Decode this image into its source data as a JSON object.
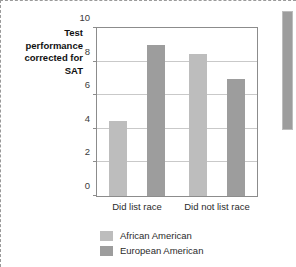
{
  "figure": {
    "axis_title": "Test\nperformance\ncorrected for\nSAT"
  },
  "chart_data": {
    "type": "bar",
    "title": "",
    "xlabel": "",
    "ylabel": "Test performance corrected for SAT",
    "categories": [
      "Did list race",
      "Did not list race"
    ],
    "series": [
      {
        "name": "African American",
        "color": "#bdbdbd",
        "values": [
          4.45,
          8.45
        ]
      },
      {
        "name": "European American",
        "color": "#9d9d9d",
        "values": [
          9.0,
          6.95
        ]
      }
    ],
    "ylim": [
      0,
      10
    ],
    "yticks": [
      0,
      2,
      4,
      6,
      8,
      10
    ],
    "ytick_labels": [
      "0",
      "2",
      "4",
      "6",
      "8",
      "10"
    ],
    "gridlines": [
      2,
      4,
      6,
      8
    ],
    "grid": true,
    "legend_position": "bottom-left"
  },
  "scrollbar": {
    "label": "vertical-scrollbar"
  }
}
